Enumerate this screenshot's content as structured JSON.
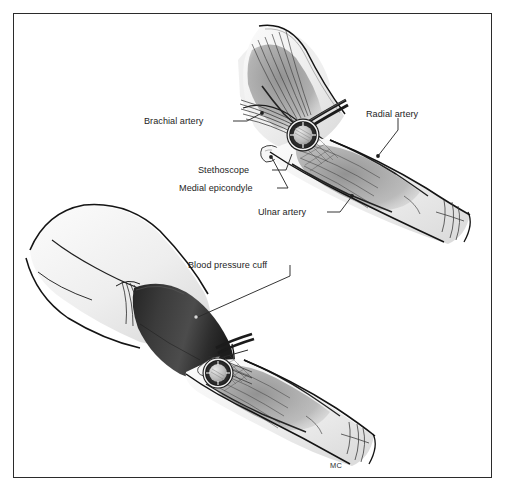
{
  "figure": {
    "artist_signature": "MC",
    "frame_color": "#2b2b2b",
    "background_color": "#ffffff"
  },
  "palette": {
    "skin_light": "#f2f2f2",
    "skin_shadow": "#d8d8d8",
    "muscle_mid": "#9a9a9a",
    "muscle_dark": "#6e6e6e",
    "vessel_dark": "#2a2a2a",
    "cuff_dark": "#303030",
    "cuff_highlight": "#4a4a4a",
    "outline": "#1a1a1a",
    "label_text": "#1d1d1d",
    "leader_line": "#2a2a2a"
  },
  "labels": [
    {
      "id": "brachial-artery",
      "text": "Brachial artery",
      "x": 144,
      "y": 117,
      "anchor": "right"
    },
    {
      "id": "radial-artery",
      "text": "Radial artery",
      "x": 366,
      "y": 110,
      "anchor": "left"
    },
    {
      "id": "stethoscope",
      "text": "Stethoscope",
      "x": 198,
      "y": 166,
      "anchor": "right"
    },
    {
      "id": "medial-epicondyle",
      "text": "Medial epicondyle",
      "x": 179,
      "y": 184,
      "anchor": "right"
    },
    {
      "id": "ulnar-artery",
      "text": "Ulnar artery",
      "x": 258,
      "y": 208,
      "anchor": "right"
    },
    {
      "id": "blood-pressure-cuff",
      "text": "Blood pressure cuff",
      "x": 188,
      "y": 261,
      "anchor": "right"
    }
  ],
  "views": {
    "upper": {
      "name": "close-up view of elbow with stethoscope",
      "parts": [
        "upper arm with biceps",
        "antecubital fossa",
        "stethoscope chest piece",
        "forearm flexor muscles",
        "wrist"
      ]
    },
    "lower": {
      "name": "arm with blood pressure cuff applied",
      "parts": [
        "shoulder and upper arm",
        "blood pressure cuff",
        "stethoscope chest piece",
        "forearm",
        "wrist"
      ]
    }
  },
  "sig_pos": {
    "x": 330,
    "y": 461
  }
}
